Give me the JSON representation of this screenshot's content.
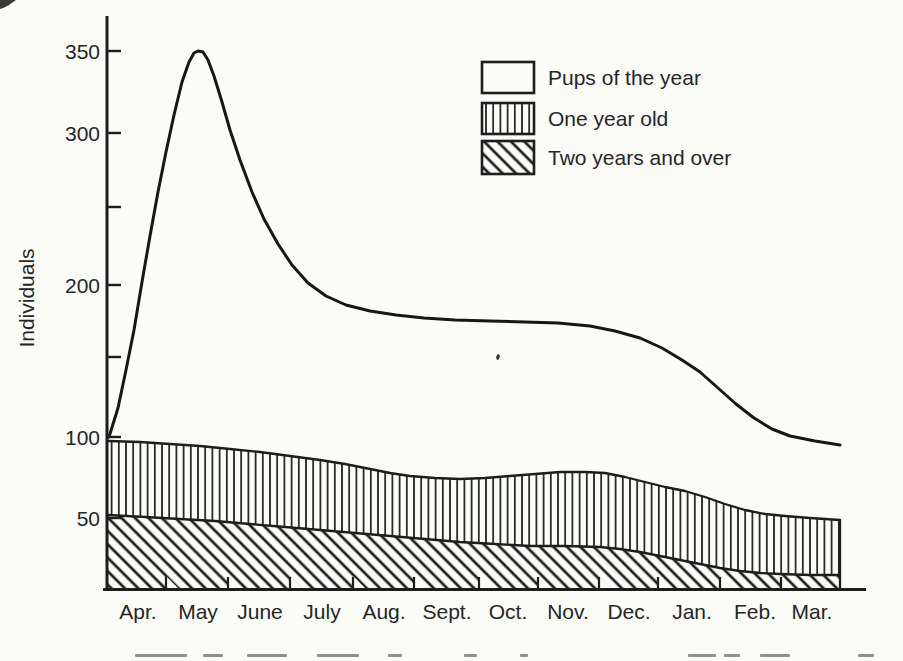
{
  "figure": {
    "background": "#fbfbf8",
    "ink": "#1d1d1d",
    "note": "Scanned book figure: stacked-area population graph with hatched bands"
  },
  "y_axis": {
    "label": "Individuals",
    "tick_labels": [
      "350",
      "300",
      "200",
      "100",
      "50"
    ],
    "unlabeled_tick_values": [
      250,
      150
    ]
  },
  "legend": {
    "items": [
      {
        "label": "Pups of the year",
        "swatch": "plain-white-box"
      },
      {
        "label": "One year old",
        "swatch": "vertical-stripes-box"
      },
      {
        "label": "Two years and over",
        "swatch": "diagonal-hatch-box"
      }
    ]
  },
  "chart_data": {
    "type": "area",
    "stacked": true,
    "title": "",
    "xlabel": "",
    "ylabel": "Individuals",
    "ylim": [
      0,
      375
    ],
    "yticks_labeled": [
      50,
      100,
      200,
      300,
      350
    ],
    "yticks_unlabeled": [
      150,
      250
    ],
    "grid": false,
    "legend_position": "top-right-inside",
    "months": [
      "Apr.",
      "May",
      "June",
      "July",
      "Aug.",
      "Sept.",
      "Oct.",
      "Nov.",
      "Dec.",
      "Jan.",
      "Feb.",
      "Mar."
    ],
    "x_sample_positions": [
      "Apr start",
      "May start",
      "Jun start",
      "Jul start",
      "Aug start",
      "Sep start",
      "Oct start",
      "Nov start",
      "Dec start",
      "Jan start",
      "Feb start",
      "Mar start",
      "Mar end"
    ],
    "stack_boundaries": {
      "total_individuals": [
        100,
        270,
        300,
        212,
        189,
        180,
        178,
        176,
        172,
        160,
        133,
        105,
        95
      ],
      "one_year_plus_older_boundary": [
        98,
        96,
        94,
        89,
        83,
        76,
        74,
        77,
        77,
        68,
        60,
        50,
        47
      ],
      "two_years_and_over_boundary": [
        50,
        48,
        46,
        43,
        39,
        36,
        33,
        31,
        29,
        24,
        16,
        12,
        12
      ]
    },
    "peak": {
      "series": "total_individuals",
      "x": "mid-May",
      "value": 350
    },
    "series": [
      {
        "name": "Pups of the year",
        "fill": "white",
        "values": [
          2,
          174,
          206,
          123,
          106,
          104,
          104,
          99,
          95,
          92,
          73,
          55,
          48
        ]
      },
      {
        "name": "One year old",
        "fill": "vertical-stripes",
        "values": [
          48,
          48,
          48,
          46,
          44,
          40,
          41,
          46,
          48,
          44,
          44,
          38,
          35
        ]
      },
      {
        "name": "Two years and over",
        "fill": "diagonal-hatch",
        "values": [
          50,
          48,
          46,
          43,
          39,
          36,
          33,
          31,
          29,
          24,
          16,
          12,
          12
        ]
      }
    ]
  },
  "caption": {
    "note": "Figure caption cut off at bottom page edge; only illegible letter tops visible",
    "fragments": [
      {
        "x": 135,
        "w": 52
      },
      {
        "x": 203,
        "w": 20
      },
      {
        "x": 247,
        "w": 40
      },
      {
        "x": 317,
        "w": 42
      },
      {
        "x": 388,
        "w": 14
      },
      {
        "x": 464,
        "w": 13
      },
      {
        "x": 520,
        "w": 8
      },
      {
        "x": 688,
        "w": 28
      },
      {
        "x": 724,
        "w": 16
      },
      {
        "x": 760,
        "w": 30
      },
      {
        "x": 858,
        "w": 16
      }
    ]
  },
  "scan_artifacts": {
    "top_left_corner_smudge": true,
    "mid_chart_speck": {
      "x": 498,
      "y": 357
    }
  }
}
